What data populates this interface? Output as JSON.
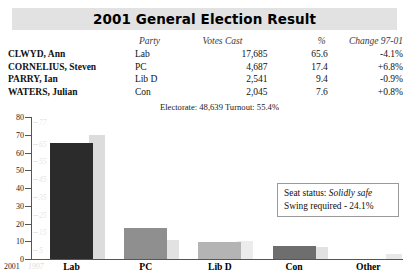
{
  "header": {
    "title": "2001 General Election Result"
  },
  "results_table": {
    "columns": {
      "candidate": "",
      "party": "Party",
      "votes": "Votes Cast",
      "percent": "%",
      "change": "Change 97-01"
    },
    "rows": [
      {
        "candidate": "CLWYD, Ann",
        "party": "Lab",
        "votes": "17,685",
        "percent": "65.6",
        "change": "-4.1%"
      },
      {
        "candidate": "CORNELIUS, Steven",
        "party": "PC",
        "votes": "4,687",
        "percent": "17.4",
        "change": "+6.8%"
      },
      {
        "candidate": "PARRY, Ian",
        "party": "Lib D",
        "votes": "2,541",
        "percent": "9.4",
        "change": "-0.9%"
      },
      {
        "candidate": "WATERS, Julian",
        "party": "Con",
        "votes": "2,045",
        "percent": "7.6",
        "change": "+0.8%"
      }
    ]
  },
  "electorate_line": "Electorate: 48,639  Turnout: 55.4%",
  "seat_status": {
    "status_label": "Seat status:",
    "status_value": "Solidly safe",
    "swing_line": "Swing required - 24.1%"
  },
  "legend": {
    "current_year": "2001",
    "previous_year": "1997"
  },
  "chart_data": {
    "type": "bar",
    "title": "2001 General Election Result",
    "xlabel": "",
    "ylabel": "",
    "ylim": [
      0,
      80
    ],
    "yticks": [
      0,
      10,
      20,
      30,
      40,
      50,
      60,
      70,
      80
    ],
    "ytick_labels": [
      "0",
      "10",
      "20",
      "30",
      "40",
      "50",
      "60",
      "70",
      "80"
    ],
    "ghost_ytick_labels": [
      "5",
      "15",
      "25",
      "35",
      "45",
      "55",
      "65",
      "77"
    ],
    "ghost_yticks": [
      5,
      15,
      25,
      35,
      45,
      55,
      65,
      77
    ],
    "grid": false,
    "legend_position": "bottom-left",
    "categories": [
      "Lab",
      "PC",
      "Lib D",
      "Con",
      "Other"
    ],
    "series": [
      {
        "name": "2001",
        "color": "#2b2b2b",
        "values": [
          65.6,
          17.4,
          9.4,
          7.6,
          0.0
        ]
      },
      {
        "name": "1997",
        "color": "#dcdcdc",
        "values": [
          69.7,
          10.6,
          10.3,
          6.8,
          2.6
        ]
      }
    ]
  },
  "bar_colors": {
    "lab_2001": "#2b2b2b",
    "lab_1997": "#dcdcdc",
    "pc_2001": "#8f8f8f",
    "pc_1997": "#e2e2e2",
    "libd_2001": "#b4b4b4",
    "libd_1997": "#ececec",
    "con_2001": "#6e6e6e",
    "con_1997": "#e2e2e2",
    "other_2001": "#ffffff",
    "other_1997": "#e8e8e8"
  }
}
